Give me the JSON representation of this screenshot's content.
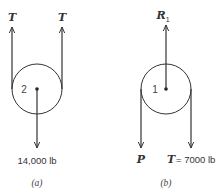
{
  "figure": {
    "panel_a": {
      "caption": "(a)",
      "pulley_label": "2",
      "left_force_label": "T",
      "right_force_label": "T",
      "load_label": "14,000 lb"
    },
    "panel_b": {
      "caption": "(b)",
      "pulley_label": "1",
      "reaction_label": "R",
      "reaction_subscript": "1",
      "left_force_label": "P",
      "right_force_label": "T",
      "right_force_value": "= 7000 lb"
    },
    "colors": {
      "line": "#333333",
      "text": "#333333",
      "background": "#ffffff"
    }
  }
}
